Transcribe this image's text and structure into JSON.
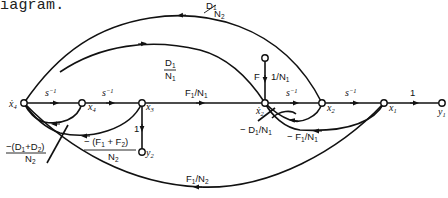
{
  "caption": "iagram.",
  "diagram": {
    "type": "signal-flow-graph",
    "nodes": [
      {
        "id": "x4dot",
        "label": "ẋ",
        "sub": "4",
        "x": 24,
        "y": 103
      },
      {
        "id": "x4",
        "label": "x",
        "sub": "4",
        "x": 82,
        "y": 103
      },
      {
        "id": "x3",
        "label": "x",
        "sub": "3",
        "x": 142,
        "y": 103
      },
      {
        "id": "x2dot",
        "label": "ẋ",
        "sub": "2",
        "x": 265,
        "y": 103
      },
      {
        "id": "x2",
        "label": "x",
        "sub": "2",
        "x": 322,
        "y": 103
      },
      {
        "id": "x1",
        "label": "x",
        "sub": "1",
        "x": 384,
        "y": 103
      },
      {
        "id": "y1",
        "label": "y",
        "sub": "1",
        "x": 442,
        "y": 103
      },
      {
        "id": "F",
        "label": "F",
        "x": 265,
        "y": 58
      },
      {
        "id": "y2",
        "label": "y",
        "sub": "2",
        "x": 142,
        "y": 152
      }
    ],
    "edges": [
      {
        "from": "x4dot",
        "to": "x4",
        "gain": "s⁻¹"
      },
      {
        "from": "x4",
        "to": "x3",
        "gain": "s⁻¹"
      },
      {
        "from": "x3",
        "to": "x2dot",
        "gain": "F1/N1"
      },
      {
        "from": "x2dot",
        "to": "x2",
        "gain": "s⁻¹"
      },
      {
        "from": "x2",
        "to": "x1",
        "gain": "s⁻¹"
      },
      {
        "from": "x1",
        "to": "y1",
        "gain": "1"
      },
      {
        "from": "F",
        "to": "x2dot",
        "gain": "1/N1"
      },
      {
        "from": "x3",
        "to": "y2",
        "gain": "1"
      },
      {
        "from": "x4dot",
        "to": "x2dot",
        "gain": "D1/N1"
      },
      {
        "from": "x2",
        "to": "x4dot",
        "gain": "D1/N2"
      },
      {
        "from": "x4",
        "to": "x4dot",
        "gain": "-(D1+D2)/N2"
      },
      {
        "from": "x3",
        "to": "x4dot",
        "gain": "-(F1+F2)/N2"
      },
      {
        "from": "x2",
        "to": "x2dot",
        "gain": "-D1/N1"
      },
      {
        "from": "x1",
        "to": "x2dot",
        "gain": "-F1/N1"
      },
      {
        "from": "x1",
        "to": "x4dot",
        "gain": "F1/N2"
      }
    ]
  },
  "labels": {
    "s_inv": "s",
    "minus_one": "−1",
    "one": "1",
    "F": "F",
    "x": "x",
    "y": "y",
    "xdot": "ẋ",
    "sub1": "1",
    "sub2": "2",
    "sub3": "3",
    "sub4": "4",
    "F1N1_num": "F",
    "N": "N",
    "D": "D",
    "slash": "/",
    "minus": "−",
    "D1_N2_top": "D",
    "neg_D1D2_num": "−(D",
    "plus_D": "+D",
    "close": ")",
    "neg_F1F2_num": "− (F",
    "plus_F": " + F",
    "neg_D1": "− D",
    "neg_F1": "− F",
    "oneN1": "1/N"
  }
}
